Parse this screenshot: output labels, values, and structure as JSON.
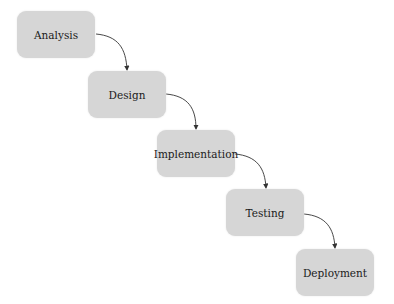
{
  "diagram": {
    "type": "waterfall-flow",
    "nodes": [
      {
        "id": "analysis",
        "label": "Analysis"
      },
      {
        "id": "design",
        "label": "Design"
      },
      {
        "id": "implementation",
        "label": "Implementation"
      },
      {
        "id": "testing",
        "label": "Testing"
      },
      {
        "id": "deployment",
        "label": "Deployment"
      }
    ],
    "edges": [
      {
        "from": "analysis",
        "to": "design"
      },
      {
        "from": "design",
        "to": "implementation"
      },
      {
        "from": "implementation",
        "to": "testing"
      },
      {
        "from": "testing",
        "to": "deployment"
      }
    ],
    "colors": {
      "node_fill": "#d6d6d6",
      "edge": "#333333",
      "text": "#1a1a1a"
    }
  }
}
